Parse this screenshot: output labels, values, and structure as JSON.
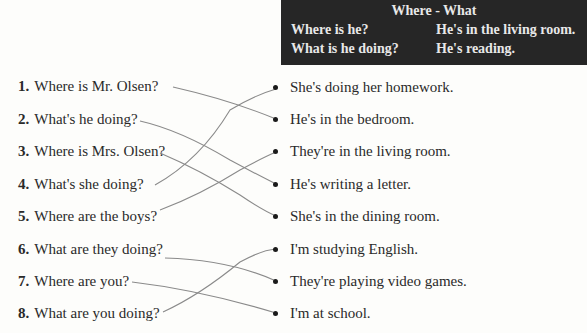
{
  "header": {
    "title": "Where - What",
    "rows": [
      {
        "question": "Where is he?",
        "answer": "He's in the living room."
      },
      {
        "question": "What is he doing?",
        "answer": "He's reading."
      }
    ]
  },
  "questions": [
    {
      "num": "1.",
      "text": "Where is Mr. Olsen?"
    },
    {
      "num": "2.",
      "text": "What's he doing?"
    },
    {
      "num": "3.",
      "text": "Where is Mrs. Olsen?"
    },
    {
      "num": "4.",
      "text": "What's she doing?"
    },
    {
      "num": "5.",
      "text": "Where are the boys?"
    },
    {
      "num": "6.",
      "text": "What are they doing?"
    },
    {
      "num": "7.",
      "text": "Where are you?"
    },
    {
      "num": "8.",
      "text": "What are you doing?"
    }
  ],
  "answers": [
    {
      "text": "She's doing her homework."
    },
    {
      "text": "He's in the bedroom."
    },
    {
      "text": "They're in the living room."
    },
    {
      "text": "He's writing a letter."
    },
    {
      "text": "She's in the dining room."
    },
    {
      "text": "I'm studying English."
    },
    {
      "text": "They're playing video games."
    },
    {
      "text": "I'm at school."
    }
  ],
  "matches": [
    {
      "question": 1,
      "answer": 2
    },
    {
      "question": 2,
      "answer": 4
    },
    {
      "question": 3,
      "answer": 5
    },
    {
      "question": 4,
      "answer": 1
    },
    {
      "question": 5,
      "answer": 3
    },
    {
      "question": 6,
      "answer": 7
    },
    {
      "question": 7,
      "answer": 8
    },
    {
      "question": 8,
      "answer": 6
    }
  ],
  "colors": {
    "header_bg": "#262626",
    "header_text": "#e8e8e8",
    "line": "#8a8a8a"
  }
}
